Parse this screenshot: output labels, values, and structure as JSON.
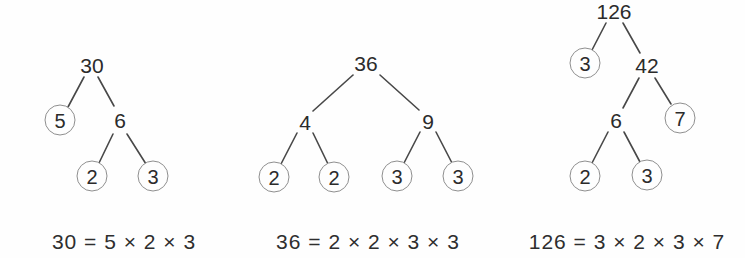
{
  "figure": {
    "description_label": "",
    "colors": {
      "background": "#fefefe",
      "text": "#2b2b2b",
      "circle_stroke": "#8f8f8f",
      "edge_stroke": "#484848"
    }
  },
  "trees": [
    {
      "number": "30",
      "nodes": [
        {
          "value": "30",
          "circled": false
        },
        {
          "value": "5",
          "circled": true
        },
        {
          "value": "6",
          "circled": false
        },
        {
          "value": "2",
          "circled": true
        },
        {
          "value": "3",
          "circled": true
        }
      ],
      "edges": [
        [
          0,
          1
        ],
        [
          0,
          2
        ],
        [
          2,
          3
        ],
        [
          2,
          4
        ]
      ],
      "equation": "30 = 5 × 2 × 3"
    },
    {
      "number": "36",
      "nodes": [
        {
          "value": "36",
          "circled": false
        },
        {
          "value": "4",
          "circled": false
        },
        {
          "value": "9",
          "circled": false
        },
        {
          "value": "2",
          "circled": true
        },
        {
          "value": "2",
          "circled": true
        },
        {
          "value": "3",
          "circled": true
        },
        {
          "value": "3",
          "circled": true
        }
      ],
      "edges": [
        [
          0,
          1
        ],
        [
          0,
          2
        ],
        [
          1,
          3
        ],
        [
          1,
          4
        ],
        [
          2,
          5
        ],
        [
          2,
          6
        ]
      ],
      "equation": "36 = 2 × 2 × 3 × 3"
    },
    {
      "number": "126",
      "nodes": [
        {
          "value": "126",
          "circled": false
        },
        {
          "value": "3",
          "circled": true
        },
        {
          "value": "42",
          "circled": false
        },
        {
          "value": "6",
          "circled": false
        },
        {
          "value": "7",
          "circled": true
        },
        {
          "value": "2",
          "circled": true
        },
        {
          "value": "3",
          "circled": true
        }
      ],
      "edges": [
        [
          0,
          1
        ],
        [
          0,
          2
        ],
        [
          2,
          3
        ],
        [
          2,
          4
        ],
        [
          3,
          5
        ],
        [
          3,
          6
        ]
      ],
      "equation": "126 = 3 × 2 × 3 × 7"
    }
  ]
}
